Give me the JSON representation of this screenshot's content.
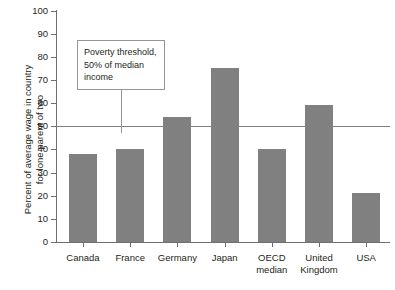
{
  "chart_data": {
    "type": "bar",
    "title": "",
    "xlabel": "",
    "ylabel": "Percent of average wage in country\nfor lone parent of two",
    "categories": [
      "Canada",
      "France",
      "Germany",
      "Japan",
      "OECD\nmedian",
      "United\nKingdom",
      "USA"
    ],
    "values": [
      38,
      40,
      54,
      75,
      40,
      59,
      21
    ],
    "ylim": [
      0,
      100
    ],
    "yticks": [
      0,
      10,
      20,
      30,
      40,
      50,
      60,
      70,
      80,
      90,
      100
    ],
    "ytick_labels": [
      "0",
      "10",
      "20",
      "30",
      "40",
      "50",
      "60",
      "70",
      "80",
      "90",
      "100"
    ],
    "grid": false,
    "legend": "none",
    "bar_color": "#808080",
    "axis_color": "#6d6e71",
    "annotations": [
      {
        "text": "Poverty threshold,\n50% of median\nincome",
        "value": 50,
        "line_color": "#808080",
        "box_border_color": "#939598"
      }
    ]
  }
}
